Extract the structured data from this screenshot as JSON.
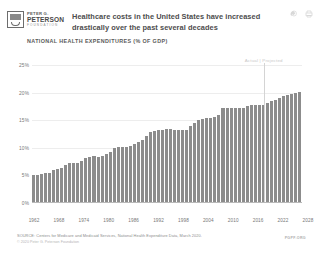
{
  "header": {
    "logo": {
      "line1": "PETER G.",
      "line2": "PETERSON",
      "line3": "FOUNDATION",
      "icon": "peterson-foundation-logo-icon"
    },
    "headline": "Healthcare costs in the United States have increased drastically over the past several decades",
    "icons": [
      {
        "name": "share-icon",
        "glyph": "share"
      },
      {
        "name": "print-icon",
        "glyph": "print"
      }
    ]
  },
  "chart_title": "NATIONAL HEALTH EXPENDITURES (% OF GDP)",
  "footer": {
    "source": "SOURCE: Centers for Medicare and Medicaid Services, National Health Expenditure Data, March 2020.",
    "copyright": "© 2020 Peter G. Peterson Foundation",
    "mark": "PGPF.ORG"
  },
  "chart_data": {
    "type": "bar",
    "title": "National Health Expenditures (% of GDP)",
    "xlabel": "",
    "ylabel": "% of GDP",
    "ylim": [
      0,
      25
    ],
    "yticks": [
      0,
      5,
      10,
      15,
      20,
      25
    ],
    "ytick_labels": [
      "0%",
      "5%",
      "10%",
      "15%",
      "20%",
      "25%"
    ],
    "grid": true,
    "legend": false,
    "annotations": [
      {
        "text": "Actual | Projected",
        "at_x": 2019,
        "type": "divider-label"
      }
    ],
    "divider_x": 2019,
    "xtick_labels": [
      "1962",
      "1968",
      "1974",
      "1980",
      "1986",
      "1992",
      "1998",
      "2004",
      "2010",
      "2016",
      "2022",
      "2028"
    ],
    "x": [
      1962,
      1963,
      1964,
      1965,
      1966,
      1967,
      1968,
      1969,
      1970,
      1971,
      1972,
      1973,
      1974,
      1975,
      1976,
      1977,
      1978,
      1979,
      1980,
      1981,
      1982,
      1983,
      1984,
      1985,
      1986,
      1987,
      1988,
      1989,
      1990,
      1991,
      1992,
      1993,
      1994,
      1995,
      1996,
      1997,
      1998,
      1999,
      2000,
      2001,
      2002,
      2003,
      2004,
      2005,
      2006,
      2007,
      2008,
      2009,
      2010,
      2011,
      2012,
      2013,
      2014,
      2015,
      2016,
      2017,
      2018,
      2019,
      2020,
      2021,
      2022,
      2023,
      2024,
      2025,
      2026,
      2027,
      2028
    ],
    "values": [
      5.0,
      5.1,
      5.3,
      5.4,
      5.5,
      5.9,
      6.1,
      6.3,
      6.9,
      7.2,
      7.3,
      7.3,
      7.7,
      8.2,
      8.4,
      8.5,
      8.4,
      8.5,
      8.9,
      9.3,
      9.9,
      10.1,
      10.1,
      10.2,
      10.4,
      10.7,
      11.1,
      11.4,
      12.1,
      12.8,
      13.1,
      13.3,
      13.3,
      13.4,
      13.4,
      13.3,
      13.2,
      13.3,
      13.3,
      13.9,
      14.5,
      15.1,
      15.3,
      15.4,
      15.4,
      15.5,
      16.0,
      17.2,
      17.2,
      17.2,
      17.2,
      17.2,
      17.3,
      17.6,
      17.7,
      17.7,
      17.7,
      17.8,
      18.1,
      18.4,
      18.7,
      19.0,
      19.3,
      19.5,
      19.7,
      19.9,
      20.1
    ],
    "projected_from": 2020
  }
}
